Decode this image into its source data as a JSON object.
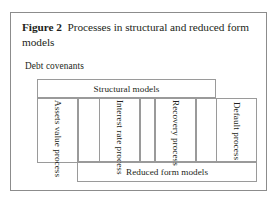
{
  "figure": {
    "label": "Figure 2",
    "caption": "Processes in structural and reduced form models"
  },
  "annotations": {
    "debt_covenants": "Debt covenants"
  },
  "diagram": {
    "type": "block-diagram",
    "bars": [
      {
        "id": "structural",
        "label": "Structural models"
      },
      {
        "id": "reduced",
        "label": "Reduced form models"
      }
    ],
    "processes": [
      {
        "id": "assets",
        "label": "Assets value process",
        "orientation": "vertical"
      },
      {
        "id": "interest",
        "label": "Interest rate process",
        "orientation": "vertical"
      },
      {
        "id": "recovery",
        "label": "Recovery process",
        "orientation": "vertical"
      },
      {
        "id": "default",
        "label": "Default process",
        "orientation": "vertical"
      }
    ]
  },
  "colors": {
    "frame_border": "#8c8c8c",
    "box_border": "#9a9a9a",
    "text": "#231f20",
    "background": "#ffffff"
  }
}
